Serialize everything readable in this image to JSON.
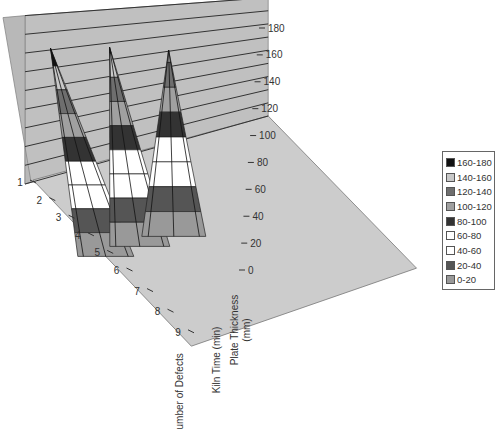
{
  "chart_data": {
    "type": "surface-3d",
    "title": "",
    "categories": [
      "1",
      "2",
      "3",
      "4",
      "5",
      "6",
      "7",
      "8",
      "9"
    ],
    "series": [
      {
        "name": "Number of Defects",
        "values": [
          0,
          45,
          90,
          135,
          175,
          135,
          90,
          45,
          0
        ]
      },
      {
        "name": "Kiln Time (min)",
        "values": [
          0,
          40,
          80,
          120,
          165,
          120,
          80,
          40,
          0
        ]
      },
      {
        "name": "Plate Thickness (mm)",
        "values": [
          0,
          35,
          70,
          105,
          150,
          105,
          70,
          35,
          0
        ]
      }
    ],
    "zlim": [
      0,
      180
    ],
    "z_ticks": [
      "0",
      "20",
      "40",
      "60",
      "80",
      "100",
      "120",
      "140",
      "160",
      "180"
    ],
    "band_colors": [
      "#999999",
      "#555555",
      "#ffffff",
      "#ffffff",
      "#333333",
      "#a0a0a0",
      "#6e6e6e",
      "#c8c8c8",
      "#111111"
    ],
    "legend": {
      "placement": "right",
      "entries": [
        "160-180",
        "140-160",
        "120-140",
        "100-120",
        "80-100",
        "60-80",
        "40-60",
        "20-40",
        "0-20"
      ],
      "colors": [
        "#111111",
        "#c8c8c8",
        "#6e6e6e",
        "#a0a0a0",
        "#333333",
        "#ffffff",
        "#ffffff",
        "#555555",
        "#999999"
      ]
    },
    "grid": true
  }
}
